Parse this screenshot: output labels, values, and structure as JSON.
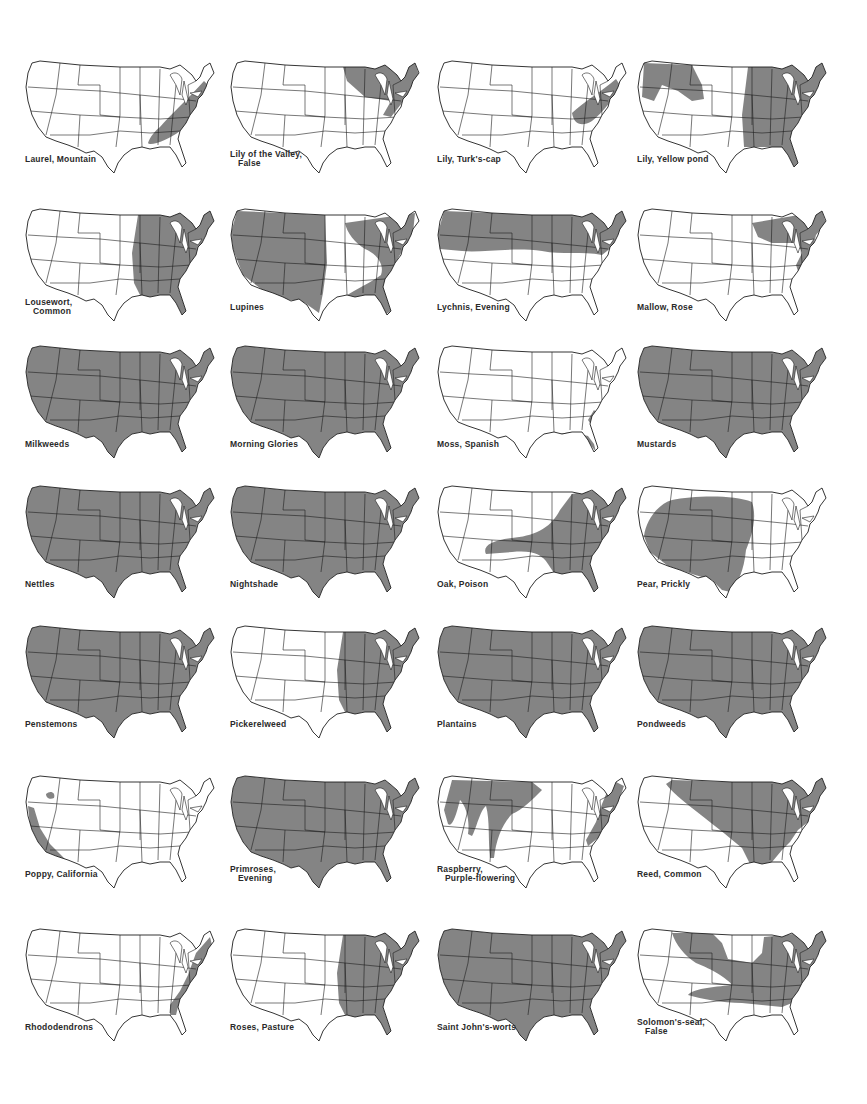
{
  "page": {
    "shade_color": "#7d7d7d",
    "outline_color": "#1e1e1e"
  },
  "maps": [
    {
      "name": "Laurel, Mountain",
      "line1": "Laurel, Mountain",
      "line2": "",
      "range": "appalachian"
    },
    {
      "name": "Lily of the Valley, False",
      "line1": "Lily of the Valley,",
      "line2": "False",
      "range": "northeast-greatlakes"
    },
    {
      "name": "Lily, Turk's-cap",
      "line1": "Lily, Turk's-cap",
      "line2": "",
      "range": "mid-atlantic"
    },
    {
      "name": "Lily, Yellow pond",
      "line1": "Lily, Yellow pond",
      "line2": "",
      "range": "east-plus-northwest"
    },
    {
      "name": "Lousewort, Common",
      "line1": "Lousewort,",
      "line2": "Common",
      "range": "east-of-plains"
    },
    {
      "name": "Lupines",
      "line1": "Lupines",
      "line2": "",
      "range": "west-plus-southeast"
    },
    {
      "name": "Lychnis, Evening",
      "line1": "Lychnis, Evening",
      "line2": "",
      "range": "northern-band"
    },
    {
      "name": "Mallow, Rose",
      "line1": "Mallow, Rose",
      "line2": "",
      "range": "greatlakes-coast"
    },
    {
      "name": "Milkweeds",
      "line1": "Milkweeds",
      "line2": "",
      "range": "all"
    },
    {
      "name": "Morning Glories",
      "line1": "Morning Glories",
      "line2": "",
      "range": "all"
    },
    {
      "name": "Moss, Spanish",
      "line1": "Moss, Spanish",
      "line2": "",
      "range": "gulf-coast"
    },
    {
      "name": "Mustards",
      "line1": "Mustards",
      "line2": "",
      "range": "all"
    },
    {
      "name": "Nettles",
      "line1": "Nettles",
      "line2": "",
      "range": "all"
    },
    {
      "name": "Nightshade",
      "line1": "Nightshade",
      "line2": "",
      "range": "all"
    },
    {
      "name": "Oak, Poison",
      "line1": "Oak, Poison",
      "line2": "",
      "range": "east-plus-tongue"
    },
    {
      "name": "Pear, Prickly",
      "line1": "Pear, Prickly",
      "line2": "",
      "range": "southwest-plains"
    },
    {
      "name": "Penstemons",
      "line1": "Penstemons",
      "line2": "",
      "range": "all"
    },
    {
      "name": "Pickerelweed",
      "line1": "Pickerelweed",
      "line2": "",
      "range": "east-of-plains"
    },
    {
      "name": "Plantains",
      "line1": "Plantains",
      "line2": "",
      "range": "all"
    },
    {
      "name": "Pondweeds",
      "line1": "Pondweeds",
      "line2": "",
      "range": "all"
    },
    {
      "name": "Poppy, California",
      "line1": "Poppy, California",
      "line2": "",
      "range": "pacific-coast"
    },
    {
      "name": "Primroses, Evening",
      "line1": "Primroses,",
      "line2": "Evening",
      "range": "all"
    },
    {
      "name": "Raspberry, Purple-flowering",
      "line1": "Raspberry,",
      "line2": "Purple-flowering",
      "range": "rockies-plus-appalachian"
    },
    {
      "name": "Reed, Common",
      "line1": "Reed, Common",
      "line2": "",
      "range": "diagonal-east"
    },
    {
      "name": "Rhododendrons",
      "line1": "Rhododendrons",
      "line2": "",
      "range": "atlantic-coast"
    },
    {
      "name": "Roses, Pasture",
      "line1": "Roses, Pasture",
      "line2": "",
      "range": "east-of-plains"
    },
    {
      "name": "Saint John's-worts",
      "line1": "Saint John's-worts",
      "line2": "",
      "range": "all"
    },
    {
      "name": "Solomon's-seal, False",
      "line1": "Solomon's-seal,",
      "line2": "False",
      "range": "north-and-east"
    }
  ]
}
